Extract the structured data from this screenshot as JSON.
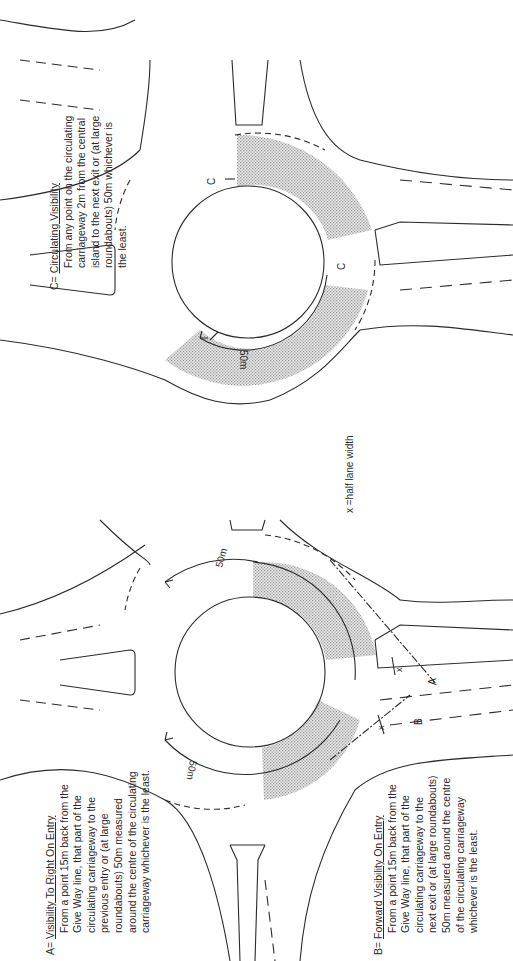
{
  "figure": {
    "orientation": "rotated-90-ccw",
    "note_label": "x =half lane width",
    "distance_label": "50m",
    "definitions": [
      {
        "key": "A=",
        "title": "Visibility To Right On Entry",
        "lines": [
          "From a point 15m back from the",
          "Give Way line, that part of the",
          "circulating carriageway to the",
          "previous entry or (at large",
          "roundabouts) 50m measured",
          "around the centre of the circulating",
          "carriageway whichever is the least."
        ]
      },
      {
        "key": "B=",
        "title": "Forward Visibility On Entry",
        "lines": [
          "From a point 15m back from the",
          "Give Way line, that part of the",
          "circulating carriageway to the",
          "next exit or (at large roundabouts)",
          "50m measured around the centre",
          "of the circulating carriageway",
          "whichever is the least."
        ]
      },
      {
        "key": "C=",
        "title": "Circulating Visibility",
        "lines": [
          "From any point on the circulating",
          "carriageway 2m from the central",
          "island to the next exit or (at large",
          "roundabouts) 50m whichever is",
          "the least."
        ]
      }
    ],
    "markers": {
      "a": "A",
      "b": "B",
      "c": "C",
      "x": "x"
    },
    "colors": {
      "line": "#2b2b2b",
      "shade": "#b8b8b8",
      "background": "#ffffff"
    }
  }
}
